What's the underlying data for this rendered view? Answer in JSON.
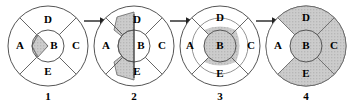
{
  "figure": {
    "title": "",
    "panel_count": 4,
    "region_labels": [
      "A",
      "B",
      "C",
      "D",
      "E"
    ],
    "panel_numbers": [
      "1",
      "2",
      "3",
      "4"
    ],
    "arrow_glyph": "right-arrow",
    "colors": {
      "stroke": "#555555",
      "shade_fill": "#c9c9c9",
      "unshaded_fill": "#ffffff",
      "text": "#000000",
      "background": "#ffffff"
    }
  },
  "panels": [
    {
      "number": "1",
      "labels": {
        "A": "A",
        "B": "B",
        "C": "C",
        "D": "D",
        "E": "E"
      },
      "shaded_description": "small wedge at left edge of inner circle B",
      "shaded_regions": [
        "B-left-wedge"
      ]
    },
    {
      "number": "2",
      "labels": {
        "A": "A",
        "B": "B",
        "C": "C",
        "D": "D",
        "E": "E"
      },
      "shaded_description": "left half of inner circle B plus wedges reaching into inner D and inner E",
      "shaded_regions": [
        "B-left-half",
        "D-inner-left-wedge",
        "E-inner-left-wedge"
      ]
    },
    {
      "number": "3",
      "labels": {
        "A": "A",
        "B": "B",
        "C": "C",
        "D": "D",
        "E": "E"
      },
      "shaded_description": "full inner circle B plus inner annular band across D, C and E sectors",
      "shaded_regions": [
        "B-full",
        "D-inner-band",
        "C-inner-band",
        "E-inner-band"
      ]
    },
    {
      "number": "4",
      "labels": {
        "A": "A",
        "B": "B",
        "C": "C",
        "D": "D",
        "E": "E"
      },
      "shaded_description": "inner circle B plus entire D, C and E sectors shaded; A remains unshaded",
      "shaded_regions": [
        "B-full",
        "D-full",
        "C-full",
        "E-full"
      ]
    }
  ]
}
